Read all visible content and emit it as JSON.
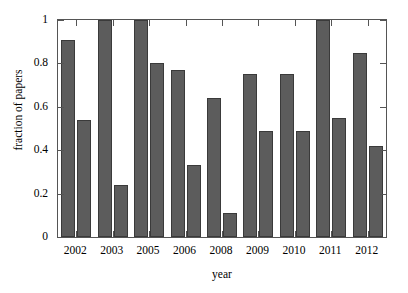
{
  "figure": {
    "width": 408,
    "height": 293,
    "top_strip_text": "",
    "background": "#ffffff",
    "frame_color": "#555555"
  },
  "chart_data": {
    "type": "bar",
    "title": "",
    "xlabel": "year",
    "ylabel": "fraction of papers",
    "categories": [
      "2002",
      "2003",
      "2005",
      "2006",
      "2008",
      "2009",
      "2010",
      "2011",
      "2012"
    ],
    "series": [
      {
        "name": "series-1",
        "color": "#5c5c5c",
        "values": [
          0.91,
          1.0,
          1.0,
          0.77,
          0.64,
          0.75,
          0.75,
          1.0,
          0.85
        ]
      },
      {
        "name": "series-2",
        "color": "#5c5c5c",
        "values": [
          0.54,
          0.24,
          0.8,
          0.33,
          0.11,
          0.49,
          0.49,
          0.55,
          0.42
        ]
      }
    ],
    "ylim": [
      0,
      1
    ],
    "yticks": [
      0,
      0.2,
      0.4,
      0.6,
      0.8,
      1
    ],
    "ytick_labels": [
      "0",
      "0.2",
      "0.4",
      "0.6",
      "0.8",
      "1"
    ],
    "grid": false,
    "legend": "none",
    "bar_color": "#5c5c5c",
    "bar_edge_color": "#3a3a3a"
  }
}
